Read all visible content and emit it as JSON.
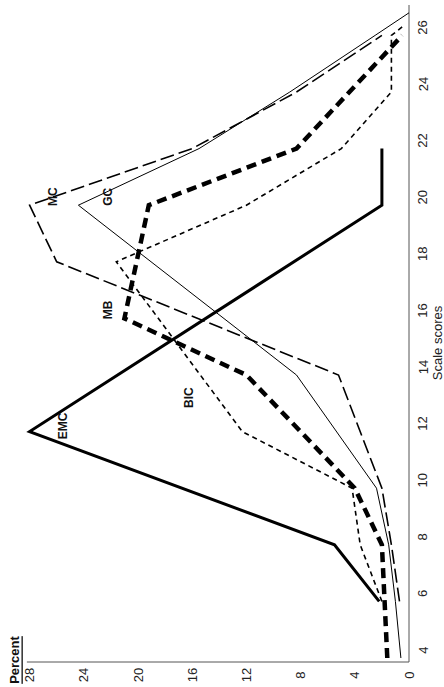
{
  "chart_data": {
    "type": "line",
    "orientation_note": "figure rendered rotated 90 degrees counter-clockwise",
    "title": "",
    "xlabel": "Scale scores",
    "ylabel": "Percent",
    "xlim": [
      4,
      27
    ],
    "ylim": [
      0,
      28
    ],
    "x_ticks": [
      4,
      6,
      8,
      10,
      12,
      14,
      16,
      18,
      20,
      22,
      24,
      26
    ],
    "y_ticks": [
      0,
      4,
      8,
      12,
      16,
      20,
      24,
      28
    ],
    "grid": false,
    "legend": "inline labels",
    "series": [
      {
        "name": "EMC",
        "style": "thick-solid",
        "points": [
          [
            6,
            2.2
          ],
          [
            8,
            5.5
          ],
          [
            12,
            28
          ],
          [
            20,
            2
          ],
          [
            22,
            2
          ]
        ],
        "label_at": [
          12.2,
          25.5
        ]
      },
      {
        "name": "GC",
        "style": "thin-solid",
        "points": [
          [
            4,
            0.6
          ],
          [
            6,
            1
          ],
          [
            8,
            1.5
          ],
          [
            10,
            2.4
          ],
          [
            14,
            8.3
          ],
          [
            20,
            24.4
          ],
          [
            22,
            15.5
          ],
          [
            24,
            8.8
          ],
          [
            26,
            2.5
          ],
          [
            26.8,
            0
          ]
        ],
        "label_at": [
          20.3,
          22.2
        ]
      },
      {
        "name": "MC",
        "style": "long-dash",
        "points": [
          [
            6,
            0.7
          ],
          [
            8,
            1.3
          ],
          [
            10,
            2
          ],
          [
            14,
            5.2
          ],
          [
            18,
            26
          ],
          [
            20,
            28
          ],
          [
            22,
            16
          ],
          [
            24,
            8.3
          ],
          [
            26,
            2
          ]
        ],
        "label_at": [
          20.3,
          26.3
        ]
      },
      {
        "name": "MB",
        "style": "thick-dash",
        "points": [
          [
            4,
            1.6
          ],
          [
            6,
            1.8
          ],
          [
            8,
            2
          ],
          [
            10,
            4
          ],
          [
            14,
            12
          ],
          [
            16,
            21
          ],
          [
            20,
            19.2
          ],
          [
            22,
            8.3
          ],
          [
            24,
            4.4
          ],
          [
            26,
            0.5
          ]
        ],
        "label_at": [
          16.3,
          22.2
        ]
      },
      {
        "name": "BIC",
        "style": "short-dash",
        "points": [
          [
            6,
            2
          ],
          [
            8,
            3.6
          ],
          [
            10,
            4.2
          ],
          [
            12,
            12.3
          ],
          [
            18,
            21.6
          ],
          [
            20,
            12
          ],
          [
            22,
            5
          ],
          [
            24,
            1.3
          ],
          [
            26,
            1.3
          ],
          [
            26.3,
            0.5
          ]
        ],
        "label_at": [
          13.2,
          16.2
        ]
      }
    ]
  }
}
